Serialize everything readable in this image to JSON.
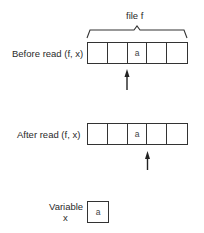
{
  "diagram": {
    "file_label": "file f",
    "before": {
      "label": "Before read (f, x)",
      "cells": [
        "",
        "",
        "a",
        "",
        ""
      ],
      "pointer_after_cell": 2
    },
    "after": {
      "label": "After read (f, x)",
      "cells": [
        "",
        "",
        "a",
        "",
        ""
      ],
      "pointer_after_cell": 3
    },
    "variable": {
      "label_line1": "Variable",
      "label_line2": "x",
      "value": "a"
    },
    "colors": {
      "stroke": "#333333",
      "text": "#2a2a2a",
      "background": "#ffffff"
    }
  }
}
